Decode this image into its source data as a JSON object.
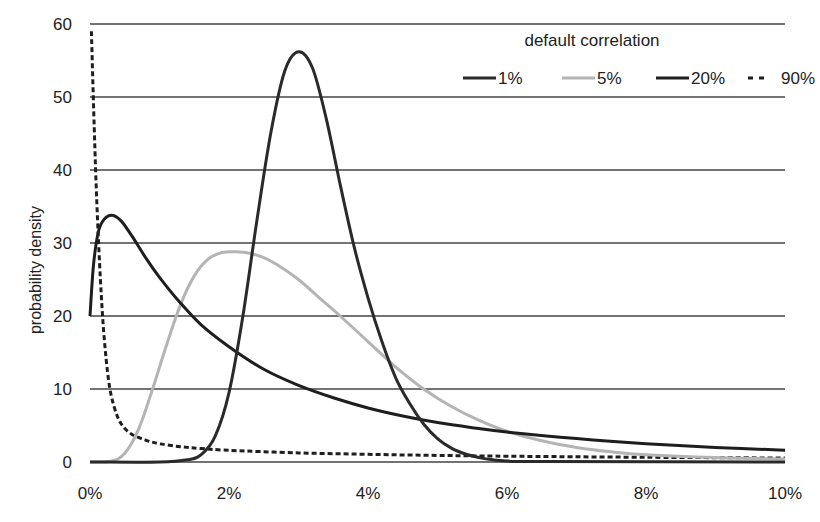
{
  "chart_data": {
    "type": "line",
    "title": "",
    "xlabel": "",
    "ylabel": "probability density",
    "xlim": [
      0,
      10
    ],
    "ylim": [
      0,
      60
    ],
    "grid": {
      "horizontal": true,
      "vertical": false
    },
    "x_ticks": [
      "0%",
      "2%",
      "4%",
      "6%",
      "8%",
      "10%"
    ],
    "x_tick_values": [
      0,
      2,
      4,
      6,
      8,
      10
    ],
    "y_ticks": [
      "0",
      "10",
      "20",
      "30",
      "40",
      "50",
      "60"
    ],
    "y_tick_values": [
      0,
      10,
      20,
      30,
      40,
      50,
      60
    ],
    "legend": {
      "title": "default correlation",
      "position": "top-right",
      "entries": [
        "1%",
        "5%",
        "20%",
        "90%"
      ]
    },
    "series": [
      {
        "name": "1%",
        "color": "#2a2a2a",
        "style": "solid",
        "x": [
          0,
          1.0,
          1.4,
          1.6,
          1.8,
          2.0,
          2.2,
          2.4,
          2.6,
          2.8,
          3.0,
          3.2,
          3.4,
          3.6,
          3.8,
          4.0,
          4.2,
          4.4,
          4.6,
          4.8,
          5.0,
          5.2,
          5.4,
          5.6,
          5.8,
          6.0,
          6.5,
          10.0
        ],
        "values": [
          0,
          0,
          0.3,
          1.0,
          3.5,
          9.5,
          20,
          33,
          45,
          53.5,
          56.2,
          54,
          47,
          38,
          29.5,
          22.5,
          16.5,
          11.5,
          8,
          5.2,
          3.2,
          1.9,
          1.1,
          0.6,
          0.3,
          0.15,
          0.05,
          0
        ]
      },
      {
        "name": "5%",
        "color": "#b4b4b4",
        "style": "solid",
        "x": [
          0,
          0.3,
          0.5,
          0.7,
          0.9,
          1.1,
          1.3,
          1.5,
          1.7,
          1.9,
          2.1,
          2.3,
          2.5,
          2.7,
          3.0,
          3.3,
          3.6,
          4.0,
          4.4,
          4.8,
          5.2,
          5.6,
          6.0,
          6.5,
          7.0,
          7.5,
          8.0,
          9.0,
          10.0
        ],
        "values": [
          0,
          0.1,
          1.2,
          4.5,
          10,
          16,
          21.5,
          25.5,
          27.8,
          28.7,
          28.8,
          28.6,
          28,
          27,
          25,
          22.5,
          20,
          16.5,
          13,
          10,
          7.6,
          5.7,
          4.2,
          2.9,
          2,
          1.4,
          1,
          0.6,
          0.4
        ]
      },
      {
        "name": "20%",
        "color": "#1e1e1e",
        "style": "solid",
        "x": [
          0,
          0.05,
          0.12,
          0.2,
          0.32,
          0.45,
          0.6,
          0.8,
          1.0,
          1.3,
          1.6,
          2.0,
          2.5,
          3.0,
          3.5,
          4.0,
          4.5,
          5.0,
          5.5,
          6.0,
          7.0,
          8.0,
          9.0,
          10.0
        ],
        "values": [
          20,
          27,
          31.5,
          33.2,
          33.8,
          33,
          31,
          28,
          25.3,
          21.8,
          18.8,
          15.8,
          12.7,
          10.5,
          8.8,
          7.4,
          6.3,
          5.4,
          4.7,
          4.1,
          3.2,
          2.5,
          2.0,
          1.6
        ]
      },
      {
        "name": "90%",
        "color": "#1e1e1e",
        "style": "dashed",
        "x": [
          0.02,
          0.06,
          0.1,
          0.15,
          0.2,
          0.27,
          0.35,
          0.45,
          0.6,
          0.8,
          1.0,
          1.3,
          1.6,
          2.0,
          3.0,
          4.0,
          5.0,
          6.0,
          8.0,
          10.0
        ],
        "values": [
          59,
          46,
          35,
          25,
          17.5,
          11,
          7.5,
          5.2,
          3.8,
          3.0,
          2.5,
          2.1,
          1.85,
          1.6,
          1.25,
          1.05,
          0.9,
          0.8,
          0.65,
          0.55
        ]
      }
    ]
  }
}
